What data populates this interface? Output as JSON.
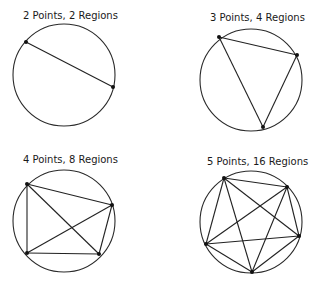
{
  "figure": {
    "colors": {
      "stroke": "#222222",
      "background": "#ffffff"
    },
    "panels": [
      {
        "title": "2 Points, 2 Regions",
        "points_count": 2,
        "regions_count": 2,
        "circle": {
          "cx": 64,
          "cy": 75,
          "r": 51
        },
        "title_pos": {
          "x": 23,
          "y": 19
        },
        "points": [
          [
            26,
            42
          ],
          [
            113,
            87
          ]
        ]
      },
      {
        "title": "3 Points, 4 Regions",
        "points_count": 3,
        "regions_count": 4,
        "circle": {
          "cx": 251,
          "cy": 80,
          "r": 51
        },
        "title_pos": {
          "x": 210,
          "y": 21
        },
        "points": [
          [
            219,
            37
          ],
          [
            297,
            55
          ],
          [
            263,
            127
          ]
        ]
      },
      {
        "title": "4 Points, 8 Regions",
        "points_count": 4,
        "regions_count": 8,
        "circle": {
          "cx": 64,
          "cy": 221,
          "r": 51
        },
        "title_pos": {
          "x": 23,
          "y": 163
        },
        "points": [
          [
            27,
            184
          ],
          [
            112,
            205
          ],
          [
            99,
            254
          ],
          [
            27,
            253
          ]
        ]
      },
      {
        "title": "5 Points, 16 Regions",
        "points_count": 5,
        "regions_count": 16,
        "circle": {
          "cx": 251,
          "cy": 222,
          "r": 51
        },
        "title_pos": {
          "x": 207,
          "y": 165
        },
        "points": [
          [
            224,
            178
          ],
          [
            287,
            187
          ],
          [
            299,
            236
          ],
          [
            252,
            272
          ],
          [
            206,
            244
          ]
        ]
      }
    ]
  }
}
